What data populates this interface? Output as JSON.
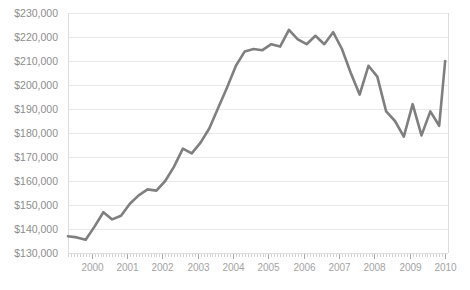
{
  "chart_data": {
    "type": "line",
    "title": "",
    "subtitle": "",
    "xlabel": "",
    "ylabel": "",
    "grid": true,
    "legend": false,
    "legend_position": "none",
    "line_color": "#7f7f7f",
    "background_color": "#ffffff",
    "gridline_color": "#e9e9e9",
    "axis_label_color": "#8d8d8d",
    "xlim": [
      1999.33,
      2010.08
    ],
    "ylim": [
      130000,
      230000
    ],
    "ytick_values": [
      130000,
      140000,
      150000,
      160000,
      170000,
      180000,
      190000,
      200000,
      210000,
      220000,
      230000
    ],
    "ytick_labels": [
      "$130,000",
      "$140,000",
      "$150,000",
      "$160,000",
      "$170,000",
      "$180,000",
      "$190,000",
      "$200,000",
      "$210,000",
      "$220,000",
      "$230,000"
    ],
    "xtick_values": [
      2000,
      2001,
      2002,
      2003,
      2004,
      2005,
      2006,
      2007,
      2008,
      2009,
      2010
    ],
    "xtick_labels": [
      "2000",
      "2001",
      "2002",
      "2003",
      "2004",
      "2005",
      "2006",
      "2007",
      "2008",
      "2009",
      "2010"
    ],
    "minor_ticks_per_interval": 12,
    "x": [
      1999.33,
      1999.58,
      1999.83,
      2000.08,
      2000.33,
      2000.58,
      2000.83,
      2001.08,
      2001.33,
      2001.58,
      2001.83,
      2002.08,
      2002.33,
      2002.58,
      2002.83,
      2003.08,
      2003.33,
      2003.58,
      2003.83,
      2004.08,
      2004.33,
      2004.58,
      2004.83,
      2005.08,
      2005.33,
      2005.58,
      2005.83,
      2006.08,
      2006.33,
      2006.58,
      2006.83,
      2007.08,
      2007.33,
      2007.58,
      2007.83,
      2008.08,
      2008.33,
      2008.58,
      2008.83,
      2009.08,
      2009.33,
      2009.58,
      2009.83,
      2010.0
    ],
    "values": [
      137000,
      136500,
      135500,
      141000,
      147000,
      144000,
      145500,
      150500,
      154000,
      156500,
      156000,
      160000,
      166000,
      173500,
      171500,
      176000,
      182000,
      190500,
      199000,
      208000,
      214000,
      215000,
      214500,
      217000,
      216000,
      223000,
      219000,
      217000,
      220500,
      217000,
      222000,
      215000,
      205000,
      196000,
      208000,
      203500,
      189000,
      185000,
      178500,
      192000,
      179000,
      189000,
      183000,
      210000
    ],
    "series_name": "Median home price",
    "series": [
      {
        "name": "Median home price",
        "color": "#7f7f7f",
        "values": [
          137000,
          136500,
          135500,
          141000,
          147000,
          144000,
          145500,
          150500,
          154000,
          156500,
          156000,
          160000,
          166000,
          173500,
          171500,
          176000,
          182000,
          190500,
          199000,
          208000,
          214000,
          215000,
          214500,
          217000,
          216000,
          223000,
          219000,
          217000,
          220500,
          217000,
          222000,
          215000,
          205000,
          196000,
          208000,
          203500,
          189000,
          185000,
          178500,
          192000,
          179000,
          189000,
          183000,
          210000
        ]
      }
    ],
    "annotations": []
  },
  "layout": {
    "plot_left": 68,
    "plot_right": 448,
    "plot_top": 13,
    "plot_bottom": 253
  }
}
